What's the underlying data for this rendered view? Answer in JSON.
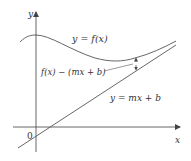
{
  "diagram": {
    "colors": {
      "stroke": "#555555",
      "text": "#333333",
      "background": "#ffffff"
    },
    "axes": {
      "x_label": "x",
      "y_label": "y",
      "origin_label": "0"
    },
    "curve": {
      "label": "y = f(x)"
    },
    "asymptote": {
      "label": "y = mx + b"
    },
    "difference": {
      "label": "f(x) − (mx + b)"
    }
  }
}
